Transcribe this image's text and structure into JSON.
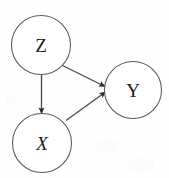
{
  "diagram": {
    "type": "directed-acyclic-graph",
    "background_color": "#fefefe",
    "node_stroke_color": "#585858",
    "edge_color": "#4a4a4a",
    "label_color": "#1b1b1b",
    "nodes": [
      {
        "id": "Z",
        "label": "Z",
        "cx": 41,
        "cy": 45,
        "r": 29.5,
        "style": "upright"
      },
      {
        "id": "X",
        "label": "X",
        "cx": 42,
        "cy": 143,
        "r": 29.5,
        "style": "italic"
      },
      {
        "id": "Y",
        "label": "Y",
        "cx": 133,
        "cy": 90,
        "r": 28.5,
        "style": "upright"
      }
    ],
    "edges": [
      {
        "id": "Z-to-X",
        "from": "Z",
        "to": "X",
        "x1": 41.5,
        "y1": 74.5,
        "x2": 41.5,
        "y2": 113.5,
        "arrow": "to"
      },
      {
        "id": "Z-to-Y",
        "from": "Z",
        "to": "Y",
        "x1": 62.5,
        "y1": 65.5,
        "x2": 105.0,
        "y2": 86.5,
        "arrow": "to"
      },
      {
        "id": "X-to-Y",
        "from": "X",
        "to": "Y",
        "x1": 66.0,
        "y1": 120.5,
        "x2": 105.5,
        "y2": 92.0,
        "arrow": "to"
      }
    ]
  }
}
